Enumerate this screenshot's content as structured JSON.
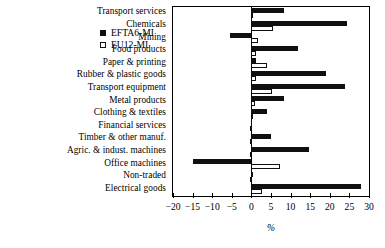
{
  "chart_data": {
    "type": "bar",
    "orientation": "horizontal",
    "title": "",
    "xlabel": "%",
    "ylabel": "",
    "xlim": [
      -20,
      30
    ],
    "xticks": [
      -20,
      -15,
      -10,
      -5,
      0,
      5,
      10,
      15,
      20,
      25,
      30
    ],
    "xticklabels": [
      "−20",
      "−15",
      "−10",
      "−5",
      "0",
      "5",
      "10",
      "15",
      "20",
      "25",
      "30"
    ],
    "grid": false,
    "legend_position": "upper right",
    "categories": [
      "Transport services",
      "Chemicals",
      "Mining",
      "Food products",
      "Paper & printing",
      "Rubber & plastic goods",
      "Transport equipment",
      "Metal products",
      "Clothing & textiles",
      "Financial services",
      "Timber & other manuf.",
      "Agric. & indust. machines",
      "Office machines",
      "Non-traded",
      "Electrical goods"
    ],
    "series": [
      {
        "name": "EFTA6-MI",
        "color": "#101010",
        "style": "filled",
        "values": [
          8.2,
          24.4,
          -5.5,
          11.8,
          1.3,
          19.1,
          23.9,
          8.3,
          4.0,
          0.0,
          5.1,
          14.6,
          -15.0,
          0.3,
          28.0
        ]
      },
      {
        "name": "EU12-MI",
        "color": "#ffffff",
        "style": "open",
        "values": [
          0.5,
          5.4,
          1.6,
          1.3,
          4.1,
          1.2,
          5.3,
          1.0,
          0.2,
          0.0,
          0.1,
          0.0,
          7.2,
          0.0,
          2.6
        ]
      }
    ]
  },
  "legend": {
    "entries": [
      {
        "label": "EFTA6-MI",
        "swatch": "filled-square-icon"
      },
      {
        "label": "EU12-MI",
        "swatch": "open-square-icon"
      }
    ]
  }
}
